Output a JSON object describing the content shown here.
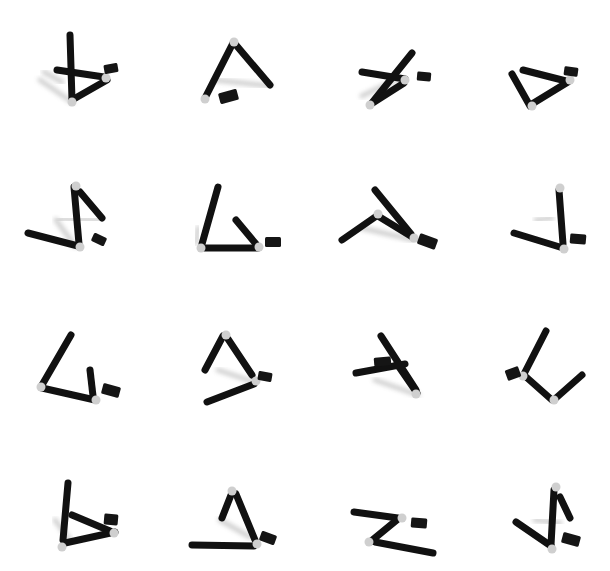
{
  "image": {
    "width": 610,
    "height": 571,
    "background": "#ffffff",
    "description": "4x4 grid of rendered black rod-and-joint figures with small black boxes and soft shadows"
  },
  "style": {
    "rod_color": "#111111",
    "rod_width": 7,
    "joint_color": "#cfcfcf",
    "box_color": "#151515",
    "shadow_color": "#9a9a9a",
    "shadow_opacity": 0.45
  },
  "figures": [
    {
      "id": "r1c1",
      "shadows": [
        [
          62,
          82,
          44,
          72
        ],
        [
          72,
          102,
          40,
          80
        ]
      ],
      "rods": [
        [
          70,
          35,
          72,
          100
        ],
        [
          57,
          70,
          104,
          77
        ],
        [
          72,
          100,
          107,
          80
        ]
      ],
      "joints": [
        [
          72,
          102
        ],
        [
          106,
          78
        ]
      ],
      "box": [
        104,
        64,
        14,
        9,
        -10
      ]
    },
    {
      "id": "r1c2",
      "shadows": [
        [
          215,
          80,
          270,
          86
        ]
      ],
      "rods": [
        [
          233,
          43,
          205,
          98
        ],
        [
          236,
          45,
          270,
          85
        ]
      ],
      "joints": [
        [
          234,
          42
        ],
        [
          205,
          99
        ]
      ],
      "box": [
        219,
        91,
        19,
        11,
        -15
      ]
    },
    {
      "id": "r1c3",
      "shadows": [
        [
          362,
          96,
          400,
          78
        ]
      ],
      "rods": [
        [
          362,
          72,
          405,
          79
        ],
        [
          371,
          104,
          412,
          53
        ],
        [
          371,
          104,
          404,
          83
        ]
      ],
      "joints": [
        [
          370,
          105
        ],
        [
          405,
          80
        ]
      ],
      "box": [
        417,
        72,
        14,
        9,
        5
      ]
    },
    {
      "id": "r1c4",
      "shadows": [],
      "rods": [
        [
          512,
          74,
          530,
          106
        ],
        [
          523,
          70,
          566,
          81
        ],
        [
          532,
          104,
          568,
          82
        ]
      ],
      "joints": [
        [
          532,
          106
        ],
        [
          570,
          80
        ]
      ],
      "box": [
        564,
        67,
        14,
        9,
        8
      ]
    },
    {
      "id": "r2c1",
      "shadows": [
        [
          60,
          219,
          100,
          220
        ],
        [
          75,
          246,
          56,
          220
        ]
      ],
      "rods": [
        [
          28,
          233,
          78,
          246
        ],
        [
          74,
          187,
          79,
          244
        ],
        [
          80,
          192,
          102,
          218
        ]
      ],
      "joints": [
        [
          76,
          186
        ],
        [
          80,
          247
        ]
      ],
      "box": [
        92,
        235,
        14,
        9,
        25
      ]
    },
    {
      "id": "r2c2",
      "shadows": [
        [
          198,
          228,
          196,
          243
        ]
      ],
      "rods": [
        [
          218,
          187,
          202,
          244
        ],
        [
          202,
          248,
          258,
          248
        ],
        [
          236,
          220,
          256,
          244
        ]
      ],
      "joints": [
        [
          201,
          248
        ],
        [
          259,
          247
        ]
      ],
      "box": [
        265,
        237,
        16,
        10,
        0
      ]
    },
    {
      "id": "r2c3",
      "shadows": [
        [
          362,
          228,
          414,
          240
        ]
      ],
      "rods": [
        [
          342,
          240,
          378,
          215
        ],
        [
          378,
          216,
          414,
          238
        ],
        [
          375,
          190,
          411,
          234
        ]
      ],
      "joints": [
        [
          378,
          214
        ],
        [
          414,
          238
        ]
      ],
      "box": [
        418,
        236,
        19,
        11,
        20
      ]
    },
    {
      "id": "r2c4",
      "shadows": [
        [
          536,
          220,
          552,
          218
        ]
      ],
      "rods": [
        [
          514,
          233,
          563,
          248
        ],
        [
          559,
          190,
          563,
          244
        ]
      ],
      "joints": [
        [
          560,
          188
        ],
        [
          564,
          249
        ]
      ],
      "box": [
        570,
        234,
        16,
        10,
        5
      ]
    },
    {
      "id": "r3c1",
      "shadows": [],
      "rods": [
        [
          71,
          335,
          42,
          385
        ],
        [
          42,
          388,
          95,
          400
        ],
        [
          90,
          370,
          93,
          396
        ]
      ],
      "joints": [
        [
          41,
          387
        ],
        [
          96,
          400
        ]
      ],
      "box": [
        102,
        385,
        18,
        11,
        15
      ]
    },
    {
      "id": "r3c2",
      "shadows": [
        [
          218,
          370,
          254,
          382
        ]
      ],
      "rods": [
        [
          223,
          336,
          205,
          370
        ],
        [
          228,
          339,
          252,
          375
        ],
        [
          207,
          402,
          254,
          384
        ]
      ],
      "joints": [
        [
          226,
          335
        ],
        [
          256,
          381
        ]
      ],
      "box": [
        258,
        372,
        14,
        9,
        10
      ]
    },
    {
      "id": "r3c3",
      "shadows": [
        [
          375,
          380,
          418,
          395
        ]
      ],
      "rods": [
        [
          381,
          336,
          416,
          390
        ],
        [
          356,
          373,
          405,
          364
        ],
        [
          397,
          364,
          417,
          393
        ]
      ],
      "joints": [
        [
          416,
          394
        ]
      ],
      "box": [
        374,
        357,
        17,
        9,
        -5
      ]
    },
    {
      "id": "r3c4",
      "shadows": [],
      "rods": [
        [
          546,
          331,
          524,
          374
        ],
        [
          525,
          376,
          552,
          400
        ],
        [
          556,
          398,
          582,
          375
        ]
      ],
      "joints": [
        [
          523,
          376
        ],
        [
          554,
          400
        ]
      ],
      "box": [
        506,
        368,
        14,
        11,
        -20
      ]
    },
    {
      "id": "r4c1",
      "shadows": [
        [
          55,
          520,
          70,
          540
        ]
      ],
      "rods": [
        [
          68,
          483,
          63,
          540
        ],
        [
          72,
          515,
          110,
          531
        ],
        [
          65,
          543,
          115,
          532
        ]
      ],
      "joints": [
        [
          62,
          547
        ],
        [
          114,
          533
        ]
      ],
      "box": [
        104,
        514,
        14,
        11,
        5
      ]
    },
    {
      "id": "r4c2",
      "shadows": [
        [
          220,
          520,
          250,
          537
        ]
      ],
      "rods": [
        [
          231,
          495,
          222,
          518
        ],
        [
          236,
          494,
          255,
          540
        ],
        [
          192,
          545,
          254,
          546
        ]
      ],
      "joints": [
        [
          232,
          491
        ],
        [
          257,
          544
        ]
      ],
      "box": [
        260,
        533,
        16,
        10,
        20
      ]
    },
    {
      "id": "r4c3",
      "shadows": [],
      "rods": [
        [
          354,
          512,
          398,
          518
        ],
        [
          398,
          519,
          370,
          542
        ],
        [
          375,
          542,
          433,
          553
        ]
      ],
      "joints": [
        [
          402,
          518
        ],
        [
          369,
          542
        ]
      ],
      "box": [
        411,
        518,
        16,
        10,
        5
      ]
    },
    {
      "id": "r4c4",
      "shadows": [
        [
          535,
          520,
          560,
          523
        ]
      ],
      "rods": [
        [
          516,
          522,
          551,
          546
        ],
        [
          554,
          490,
          551,
          545
        ],
        [
          560,
          497,
          570,
          518
        ]
      ],
      "joints": [
        [
          556,
          487
        ],
        [
          552,
          549
        ]
      ],
      "box": [
        562,
        534,
        18,
        11,
        15
      ]
    }
  ]
}
